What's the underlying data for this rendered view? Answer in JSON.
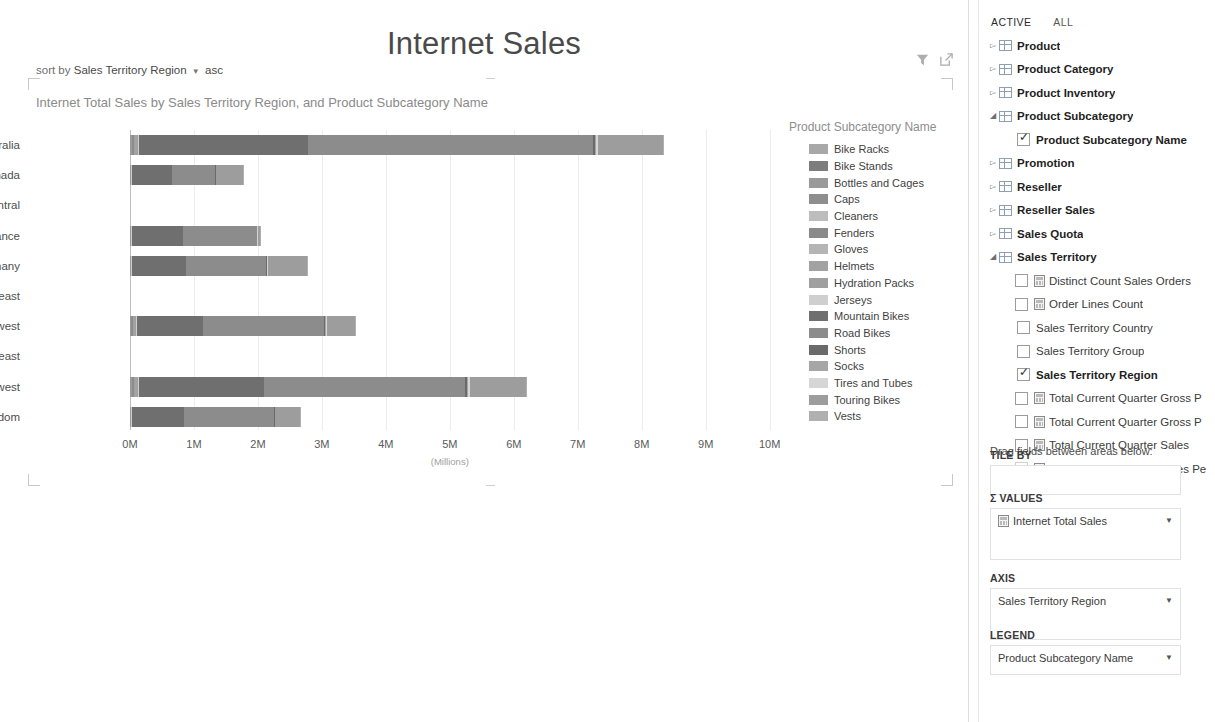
{
  "report": {
    "title": "Internet Sales"
  },
  "sortbar": {
    "prefix": "sort by",
    "field": "Sales Territory Region",
    "caret": "▼",
    "direction": "asc"
  },
  "viz": {
    "header": "Internet Total Sales by Sales Territory Region, and Product Subcategory Name",
    "tools": [
      {
        "name": "filter-icon",
        "glyph": "▼"
      },
      {
        "name": "popout-icon",
        "glyph": "⬈"
      }
    ]
  },
  "chart_data": {
    "type": "bar",
    "orientation": "horizontal",
    "stacked": true,
    "title": "Internet Total Sales by Sales Territory Region, and Product Subcategory Name",
    "xlabel": "(Millions)",
    "ylabel": "",
    "xlim": [
      0,
      10.6
    ],
    "xticks": [
      "0M",
      "1M",
      "2M",
      "3M",
      "4M",
      "5M",
      "6M",
      "7M",
      "8M",
      "9M",
      "10M"
    ],
    "xtick_values": [
      0,
      1,
      2,
      3,
      4,
      5,
      6,
      7,
      8,
      9,
      10
    ],
    "grid": true,
    "legend_position": "right",
    "legend_title": "Product Subcategory Name",
    "categories": [
      "Australia",
      "Canada",
      "Central",
      "France",
      "Germany",
      "Northeast",
      "Northwest",
      "Southeast",
      "Southwest",
      "United Kingdom"
    ],
    "series": [
      {
        "name": "Bike Racks",
        "color": "#a8a8a8",
        "values": [
          0.0,
          0.0,
          0,
          0.0,
          0.0,
          0,
          0.0,
          0,
          0.0,
          0.0
        ]
      },
      {
        "name": "Bike Stands",
        "color": "#7d7d7d",
        "values": [
          0.0,
          0.0,
          0,
          0.0,
          0.0,
          0,
          0.0,
          0,
          0.0,
          0.0
        ]
      },
      {
        "name": "Bottles and Cages",
        "color": "#9a9a9a",
        "values": [
          0.03,
          0.01,
          0,
          0.01,
          0.01,
          0,
          0.02,
          0,
          0.03,
          0.01
        ]
      },
      {
        "name": "Caps",
        "color": "#8e8e8e",
        "values": [
          0.01,
          0.0,
          0,
          0.0,
          0.0,
          0,
          0.01,
          0,
          0.01,
          0.0
        ]
      },
      {
        "name": "Cleaners",
        "color": "#bdbdbd",
        "values": [
          0.0,
          0.0,
          0,
          0.0,
          0.0,
          0,
          0.0,
          0,
          0.0,
          0.0
        ]
      },
      {
        "name": "Fenders",
        "color": "#8a8a8a",
        "values": [
          0.02,
          0.0,
          0,
          0.0,
          0.0,
          0,
          0.01,
          0,
          0.02,
          0.0
        ]
      },
      {
        "name": "Gloves",
        "color": "#b5b5b5",
        "values": [
          0.01,
          0.0,
          0,
          0.0,
          0.0,
          0,
          0.01,
          0,
          0.01,
          0.0
        ]
      },
      {
        "name": "Helmets",
        "color": "#a2a2a2",
        "values": [
          0.04,
          0.01,
          0,
          0.01,
          0.01,
          0,
          0.03,
          0,
          0.04,
          0.01
        ]
      },
      {
        "name": "Hydration Packs",
        "color": "#9f9f9f",
        "values": [
          0.01,
          0.0,
          0,
          0.0,
          0.0,
          0,
          0.01,
          0,
          0.01,
          0.0
        ]
      },
      {
        "name": "Jerseys",
        "color": "#cfcfcf",
        "values": [
          0.02,
          0.01,
          0,
          0.01,
          0.01,
          0,
          0.02,
          0,
          0.02,
          0.01
        ]
      },
      {
        "name": "Mountain Bikes",
        "color": "#6f6f6f",
        "values": [
          2.65,
          0.62,
          0,
          0.8,
          0.84,
          0,
          1.03,
          0,
          1.95,
          0.81
        ]
      },
      {
        "name": "Road Bikes",
        "color": "#8c8c8c",
        "values": [
          4.45,
          0.68,
          0,
          1.15,
          1.26,
          0,
          1.89,
          0,
          3.15,
          1.41
        ]
      },
      {
        "name": "Shorts",
        "color": "#6a6a6a",
        "values": [
          0.03,
          0.01,
          0,
          0.01,
          0.01,
          0,
          0.02,
          0,
          0.03,
          0.01
        ]
      },
      {
        "name": "Socks",
        "color": "#a6a6a6",
        "values": [
          0.01,
          0.0,
          0,
          0.0,
          0.0,
          0,
          0.01,
          0,
          0.01,
          0.0
        ]
      },
      {
        "name": "Tires and Tubes",
        "color": "#d6d6d6",
        "values": [
          0.03,
          0.01,
          0,
          0.01,
          0.01,
          0,
          0.02,
          0,
          0.03,
          0.01
        ]
      },
      {
        "name": "Touring Bikes",
        "color": "#9d9d9d",
        "values": [
          1.02,
          0.42,
          0,
          0.03,
          0.62,
          0,
          0.44,
          0,
          0.88,
          0.39
        ]
      },
      {
        "name": "Vests",
        "color": "#b0b0b0",
        "values": [
          0.02,
          0.01,
          0,
          0.01,
          0.01,
          0,
          0.01,
          0,
          0.02,
          0.01
        ]
      }
    ],
    "totals": [
      8.33,
      1.78,
      0,
      2.04,
      2.78,
      0,
      3.53,
      0,
      6.21,
      2.67
    ]
  },
  "panel": {
    "tabs": [
      {
        "label": "ACTIVE",
        "selected": true
      },
      {
        "label": "ALL",
        "selected": false
      }
    ],
    "fields": [
      {
        "label": "Product",
        "kind": "table",
        "expanded": false
      },
      {
        "label": "Product Category",
        "kind": "table",
        "expanded": false
      },
      {
        "label": "Product Inventory",
        "kind": "table",
        "expanded": false
      },
      {
        "label": "Product Subcategory",
        "kind": "table",
        "expanded": true
      },
      {
        "label": "Product Subcategory Name",
        "kind": "field",
        "checked": true,
        "bold": true
      },
      {
        "label": "Promotion",
        "kind": "table",
        "expanded": false
      },
      {
        "label": "Reseller",
        "kind": "table",
        "expanded": false
      },
      {
        "label": "Reseller Sales",
        "kind": "table",
        "expanded": false
      },
      {
        "label": "Sales Quota",
        "kind": "table",
        "expanded": false
      },
      {
        "label": "Sales Territory",
        "kind": "table",
        "expanded": true
      },
      {
        "label": "Distinct Count Sales Orders",
        "kind": "measure",
        "checked": false
      },
      {
        "label": "Order Lines Count",
        "kind": "measure",
        "checked": false
      },
      {
        "label": "Sales Territory Country",
        "kind": "field",
        "checked": false
      },
      {
        "label": "Sales Territory Group",
        "kind": "field",
        "checked": false
      },
      {
        "label": "Sales Territory Region",
        "kind": "field",
        "checked": true,
        "bold": true
      },
      {
        "label": "Total Current Quarter Gross P",
        "kind": "measure",
        "checked": false,
        "truncated": true
      },
      {
        "label": "Total Current Quarter Gross P",
        "kind": "measure",
        "checked": false,
        "truncated": true
      },
      {
        "label": "Total Current Quarter Sales",
        "kind": "measure",
        "checked": false
      },
      {
        "label": "Total Current Quarter Sales Pe",
        "kind": "measure",
        "checked": false,
        "truncated": true,
        "faded": true
      }
    ],
    "drag_hint": "Drag fields between areas below:",
    "wells": [
      {
        "label": "TILE BY",
        "chip": null
      },
      {
        "label": "Σ VALUES",
        "chip": "Internet Total Sales",
        "chip_icon": "measure"
      },
      {
        "label": "AXIS",
        "chip": "Sales Territory Region",
        "chip_icon": "none"
      },
      {
        "label": "LEGEND",
        "chip": "Product Subcategory Name",
        "chip_icon": "none"
      }
    ]
  }
}
